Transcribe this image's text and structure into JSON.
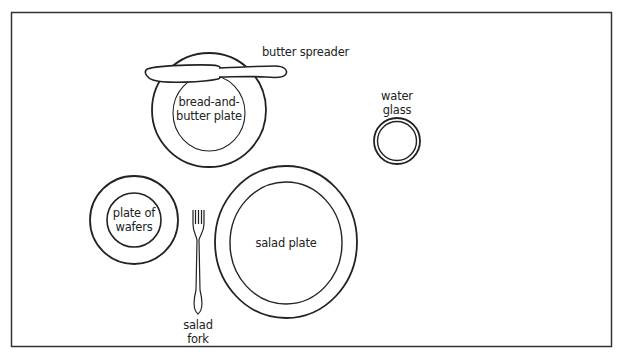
{
  "diagram": {
    "colors": {
      "stroke": "#222222",
      "background": "#ffffff",
      "border": "#333333"
    },
    "items": [
      {
        "id": "butter_spreader",
        "label": "butter spreader"
      },
      {
        "id": "bread_plate",
        "label_line1": "bread-and-",
        "label_line2": "butter plate"
      },
      {
        "id": "water_glass",
        "label_line1": "water",
        "label_line2": "glass"
      },
      {
        "id": "wafer_plate",
        "label_line1": "plate of",
        "label_line2": "wafers"
      },
      {
        "id": "salad_fork",
        "label_line1": "salad",
        "label_line2": "fork"
      },
      {
        "id": "salad_plate",
        "label": "salad plate"
      }
    ]
  }
}
